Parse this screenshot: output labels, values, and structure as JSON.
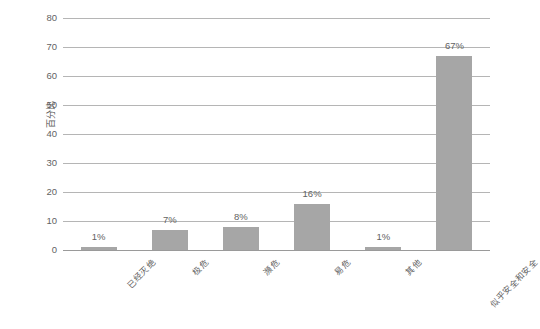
{
  "chart_data": {
    "type": "bar",
    "title": "",
    "subtitle": "",
    "xlabel": "",
    "ylabel": "百分比",
    "categories": [
      "已经灭绝",
      "极危",
      "濒危",
      "易危",
      "其他",
      "似乎安全和安全"
    ],
    "values": [
      1,
      7,
      8,
      16,
      1,
      67
    ],
    "data_labels": [
      "1%",
      "7%",
      "8%",
      "16%",
      "1%",
      "67%"
    ],
    "ylim": [
      0,
      80
    ],
    "y_ticks": [
      0,
      10,
      20,
      30,
      40,
      50,
      60,
      70,
      80
    ],
    "y_tick_labels": [
      "0",
      "10",
      "20",
      "30",
      "40",
      "50",
      "60",
      "70",
      "80"
    ],
    "grid": true,
    "grid_axis": "y",
    "legend": false,
    "legend_position": "none",
    "series": [
      {
        "name": "百分比",
        "values": [
          1,
          7,
          8,
          16,
          1,
          67
        ]
      }
    ],
    "colors": {
      "bar_fill": "#a6a6a6",
      "gridline": "#b5b5b5",
      "axis_line": "#9a9a9a",
      "text": "#595959",
      "background": "#ffffff"
    }
  }
}
